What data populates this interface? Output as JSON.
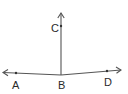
{
  "diagram": {
    "type": "geometry-rays",
    "colors": {
      "line": "#555555",
      "text": "#2a2a2a",
      "background": "#ffffff"
    },
    "vertex": {
      "label": "B",
      "x": 61,
      "y": 75,
      "label_x": 58,
      "label_y": 89
    },
    "rays": [
      {
        "name": "ray-ba",
        "to_label": "A",
        "point": {
          "x": 16,
          "y": 73
        },
        "tip": {
          "x": 3,
          "y": 72.5
        },
        "label_x": 12,
        "label_y": 89
      },
      {
        "name": "ray-bc",
        "to_label": "C",
        "point": {
          "x": 61,
          "y": 26
        },
        "tip": {
          "x": 61,
          "y": 13
        },
        "label_x": 51,
        "label_y": 32
      },
      {
        "name": "ray-bd",
        "to_label": "D",
        "point": {
          "x": 107,
          "y": 71
        },
        "tip": {
          "x": 121,
          "y": 70
        },
        "label_x": 104,
        "label_y": 86
      }
    ],
    "labels": {
      "a": "A",
      "b": "B",
      "c": "C",
      "d": "D"
    }
  }
}
